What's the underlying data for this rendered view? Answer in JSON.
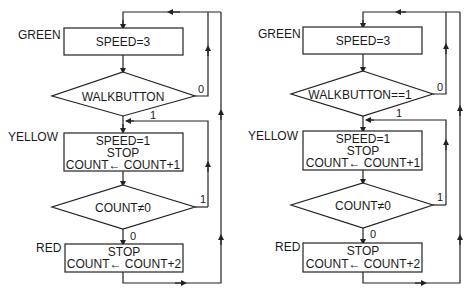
{
  "flowcharts": [
    {
      "id": "left",
      "states": {
        "green": {
          "label": "GREEN",
          "lines": [
            "SPEED=3"
          ]
        },
        "yellow": {
          "label": "YELLOW",
          "lines": [
            "SPEED=1",
            "STOP",
            "COUNT← COUNT+1"
          ]
        },
        "red": {
          "label": "RED",
          "lines": [
            "STOP",
            "COUNT← COUNT+2"
          ]
        }
      },
      "decisions": [
        {
          "condition": "WALKBUTTON",
          "branch_true": "1",
          "branch_false": "0"
        },
        {
          "condition": "COUNT≠0",
          "branch_true": "1",
          "branch_false": "0"
        }
      ]
    },
    {
      "id": "right",
      "states": {
        "green": {
          "label": "GREEN",
          "lines": [
            "SPEED=3"
          ]
        },
        "yellow": {
          "label": "YELLOW",
          "lines": [
            "SPEED=1",
            "STOP",
            "COUNT← COUNT+1"
          ]
        },
        "red": {
          "label": "RED",
          "lines": [
            "STOP",
            "COUNT← COUNT+2"
          ]
        }
      },
      "decisions": [
        {
          "condition": "WALKBUTTON==1",
          "branch_true": "1",
          "branch_false": "0"
        },
        {
          "condition": "COUNT≠0",
          "branch_true": "1",
          "branch_false": "0"
        }
      ]
    }
  ]
}
